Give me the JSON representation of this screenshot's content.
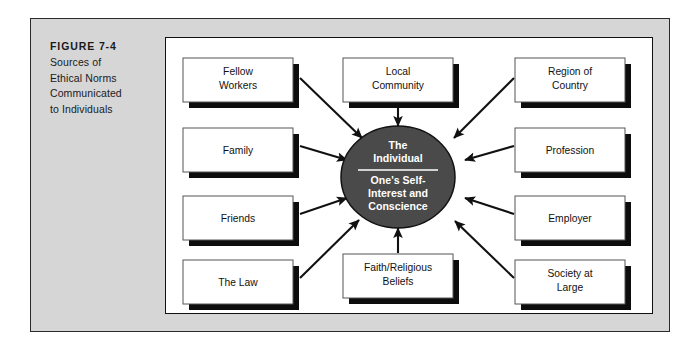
{
  "figure": {
    "number_label": "FIGURE 7-4",
    "caption_lines": [
      "Sources of",
      "Ethical Norms",
      "Communicated",
      "to Individuals"
    ]
  },
  "colors": {
    "page_background": "#ffffff",
    "panel_gray": "#d6d6d6",
    "panel_border": "#2b2b2b",
    "diagram_background": "#ffffff",
    "box_fill": "#ffffff",
    "box_border": "#555555",
    "box_shadow": "#0d0d0d",
    "center_fill": "#4a4a4a",
    "center_outline": "#111111",
    "center_text": "#ffffff",
    "arrow": "#111111",
    "label_text": "#111111"
  },
  "center": {
    "heading_lines": [
      "The",
      "Individual"
    ],
    "body_lines": [
      "One's Self-",
      "Interest and",
      "Conscience"
    ],
    "has_divider": true
  },
  "nodes": [
    {
      "id": "fellow-workers",
      "lines": [
        "Fellow",
        "Workers"
      ],
      "column": "left",
      "row": 1
    },
    {
      "id": "family",
      "lines": [
        "Family"
      ],
      "column": "left",
      "row": 2
    },
    {
      "id": "friends",
      "lines": [
        "Friends"
      ],
      "column": "left",
      "row": 3
    },
    {
      "id": "the-law",
      "lines": [
        "The Law"
      ],
      "column": "left",
      "row": 4
    },
    {
      "id": "local-community",
      "lines": [
        "Local",
        "Community"
      ],
      "column": "top",
      "row": 1
    },
    {
      "id": "faith-religious-beliefs",
      "lines": [
        "Faith/Religious",
        "Beliefs"
      ],
      "column": "bottom",
      "row": 1
    },
    {
      "id": "region-of-country",
      "lines": [
        "Region of",
        "Country"
      ],
      "column": "right",
      "row": 1
    },
    {
      "id": "profession",
      "lines": [
        "Profession"
      ],
      "column": "right",
      "row": 2
    },
    {
      "id": "employer",
      "lines": [
        "Employer"
      ],
      "column": "right",
      "row": 3
    },
    {
      "id": "society-at-large",
      "lines": [
        "Society at",
        "Large"
      ],
      "column": "right",
      "row": 4
    }
  ],
  "arrows": [
    {
      "from": "fellow-workers",
      "to": "center",
      "direction": "down-right"
    },
    {
      "from": "family",
      "to": "center",
      "direction": "right-down"
    },
    {
      "from": "friends",
      "to": "center",
      "direction": "right-up"
    },
    {
      "from": "the-law",
      "to": "center",
      "direction": "up-right"
    },
    {
      "from": "local-community",
      "to": "center",
      "direction": "down"
    },
    {
      "from": "faith-religious-beliefs",
      "to": "center",
      "direction": "up"
    },
    {
      "from": "region-of-country",
      "to": "center",
      "direction": "down-left"
    },
    {
      "from": "profession",
      "to": "center",
      "direction": "left-down"
    },
    {
      "from": "employer",
      "to": "center",
      "direction": "left-up"
    },
    {
      "from": "society-at-large",
      "to": "center",
      "direction": "up-left"
    }
  ]
}
